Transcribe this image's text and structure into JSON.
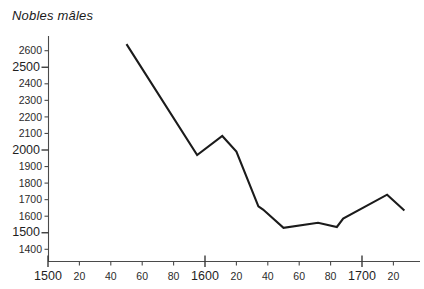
{
  "chart_data": {
    "type": "line",
    "title": "Nobles mâles",
    "xlabel": "",
    "ylabel": "",
    "grid": false,
    "legend": null,
    "xlim": [
      1500,
      1730
    ],
    "ylim": [
      1350,
      2700
    ],
    "x_ticks": [
      {
        "value": 1500,
        "label": "1500",
        "major": true
      },
      {
        "value": 1520,
        "label": "20",
        "major": false
      },
      {
        "value": 1540,
        "label": "40",
        "major": false
      },
      {
        "value": 1560,
        "label": "60",
        "major": false
      },
      {
        "value": 1580,
        "label": "80",
        "major": false
      },
      {
        "value": 1600,
        "label": "1600",
        "major": true
      },
      {
        "value": 1620,
        "label": "20",
        "major": false
      },
      {
        "value": 1640,
        "label": "40",
        "major": false
      },
      {
        "value": 1660,
        "label": "60",
        "major": false
      },
      {
        "value": 1680,
        "label": "80",
        "major": false
      },
      {
        "value": 1700,
        "label": "1700",
        "major": true
      },
      {
        "value": 1720,
        "label": "20",
        "major": false
      }
    ],
    "y_ticks": [
      {
        "value": 2600,
        "label": "2600",
        "major": false
      },
      {
        "value": 2500,
        "label": "2500",
        "major": true
      },
      {
        "value": 2400,
        "label": "2400",
        "major": false
      },
      {
        "value": 2300,
        "label": "2300",
        "major": false
      },
      {
        "value": 2200,
        "label": "2200",
        "major": false
      },
      {
        "value": 2100,
        "label": "2100",
        "major": false
      },
      {
        "value": 2000,
        "label": "2000",
        "major": true
      },
      {
        "value": 1900,
        "label": "1900",
        "major": false
      },
      {
        "value": 1800,
        "label": "1800",
        "major": false
      },
      {
        "value": 1700,
        "label": "1700",
        "major": false
      },
      {
        "value": 1600,
        "label": "1600",
        "major": false
      },
      {
        "value": 1500,
        "label": "1500",
        "major": true
      },
      {
        "value": 1400,
        "label": "1400",
        "major": false
      }
    ],
    "series": [
      {
        "name": "Nobles mâles",
        "color": "#1b1b1b",
        "points": [
          {
            "x": 1550,
            "y": 2640
          },
          {
            "x": 1595,
            "y": 1970
          },
          {
            "x": 1611,
            "y": 2085
          },
          {
            "x": 1620,
            "y": 1990
          },
          {
            "x": 1634,
            "y": 1660
          },
          {
            "x": 1637,
            "y": 1640
          },
          {
            "x": 1650,
            "y": 1530
          },
          {
            "x": 1672,
            "y": 1560
          },
          {
            "x": 1684,
            "y": 1535
          },
          {
            "x": 1688,
            "y": 1585
          },
          {
            "x": 1716,
            "y": 1730
          },
          {
            "x": 1727,
            "y": 1635
          }
        ]
      }
    ]
  }
}
